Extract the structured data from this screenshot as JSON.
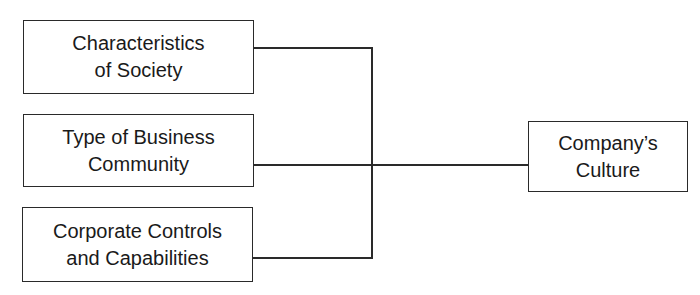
{
  "diagram": {
    "inputs": [
      {
        "line1": "Characteristics",
        "line2": "of Society"
      },
      {
        "line1": "Type of Business",
        "line2": "Community"
      },
      {
        "line1": "Corporate Controls",
        "line2": "and Capabilities"
      }
    ],
    "output": {
      "line1": "Company’s",
      "line2": "Culture"
    }
  }
}
